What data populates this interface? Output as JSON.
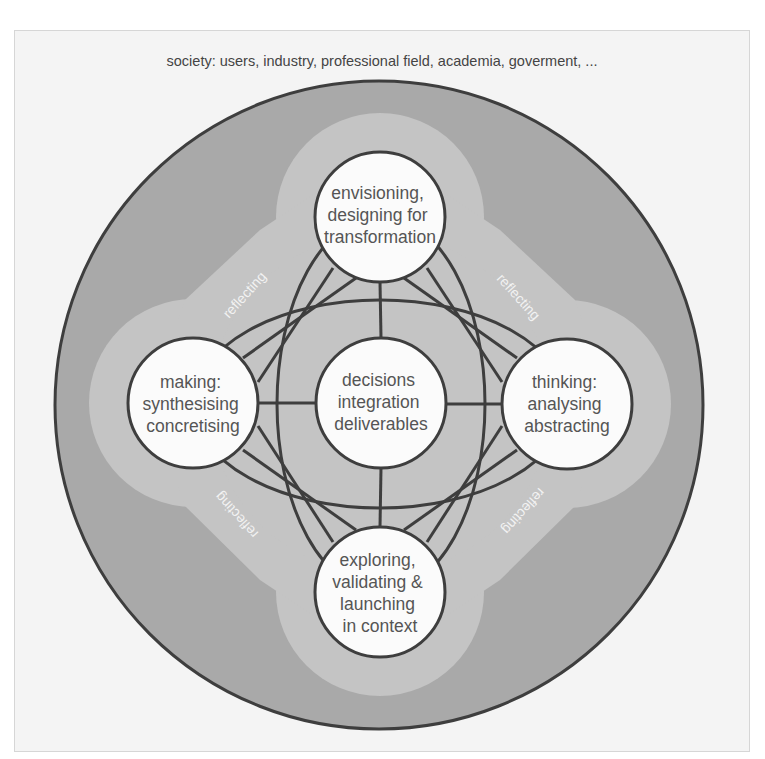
{
  "header": {
    "society_label": "society: users, industry, professional field, academia, goverment, ..."
  },
  "colors": {
    "background": "#f4f4f4",
    "outer_ring": "#a9a9a9",
    "halo": "#c4c4c4",
    "node_fill": "#fbfbfb",
    "stroke": "#3e3e3e",
    "node_text": "#555555",
    "reflect_text": "#f2f2f2"
  },
  "nodes": {
    "top": {
      "lines": [
        "envisioning,",
        "designing for",
        "transformation"
      ]
    },
    "left": {
      "lines": [
        "making:",
        "synthesising",
        "concretising"
      ]
    },
    "center": {
      "lines": [
        "decisions",
        "integration",
        "deliverables"
      ]
    },
    "right": {
      "lines": [
        "thinking:",
        "analysing",
        "abstracting"
      ]
    },
    "bottom": {
      "lines": [
        "exploring,",
        "validating &",
        "launching",
        "in context"
      ]
    }
  },
  "reflecting_labels": {
    "top_left": "reflecting",
    "top_right": "reflecting",
    "bottom_left": "reflecting",
    "bottom_right": "reflecting"
  }
}
